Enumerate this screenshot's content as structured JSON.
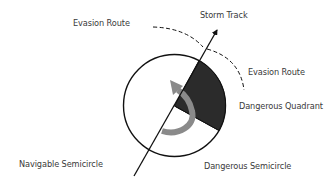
{
  "diagram": {
    "labels": {
      "storm_track": "Storm Track",
      "evasion_route_left": "Evasion Route",
      "evasion_route_right": "Evasion Route",
      "dangerous_quadrant": "Dangerous Quadrant",
      "navigable_semicircle": "Navigable Semicircle",
      "dangerous_semicircle": "Dangerous Semicircle"
    },
    "colors": {
      "background": "#ffffff",
      "outline": "#111111",
      "dangerous_quadrant_fill": "#2b2b2b",
      "rotation_arrow": "#8a8a8a",
      "label_text": "#3a3a3a"
    },
    "geometry": {
      "circle": {
        "cx": 174.5,
        "cy": 105.5,
        "r": 51
      },
      "storm_track": {
        "x1": 134,
        "y1": 176,
        "x2": 218,
        "y2": 28
      },
      "dangerous_quadrant_arc_start": [
        199,
        61
      ],
      "dangerous_quadrant_arc_end": [
        219,
        130
      ],
      "rotation": "counterclockwise"
    }
  }
}
